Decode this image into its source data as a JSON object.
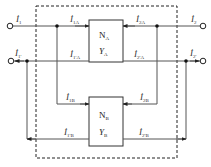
{
  "diagram": {
    "type": "two-port parallel connection",
    "colors": {
      "wire": "#555555",
      "box": "#333333",
      "dashed": "#222222",
      "background": "#ffffff"
    },
    "boxes": [
      {
        "id": "A",
        "name": "N",
        "name_sub": "A",
        "param": "Y",
        "param_sub": "A"
      },
      {
        "id": "B",
        "name": "N",
        "name_sub": "B",
        "param": "Y",
        "param_sub": "B"
      }
    ],
    "currents": {
      "i1": {
        "main": "İ",
        "sub": "1"
      },
      "i1p": {
        "main": "İ",
        "sub": "1'"
      },
      "i2": {
        "main": "İ",
        "sub": "2"
      },
      "i2p": {
        "main": "İ",
        "sub": "2'"
      },
      "i1a": {
        "main": "İ",
        "sub": "1A"
      },
      "i1pa": {
        "main": "İ",
        "sub": "1'A"
      },
      "i2a": {
        "main": "İ",
        "sub": "2A"
      },
      "i2pa": {
        "main": "İ",
        "sub": "2'A"
      },
      "i1b": {
        "main": "İ",
        "sub": "1B"
      },
      "i1pb": {
        "main": "İ",
        "sub": "1'B"
      },
      "i2b": {
        "main": "İ",
        "sub": "2B"
      },
      "i2pb": {
        "main": "İ",
        "sub": "2'B"
      }
    }
  }
}
